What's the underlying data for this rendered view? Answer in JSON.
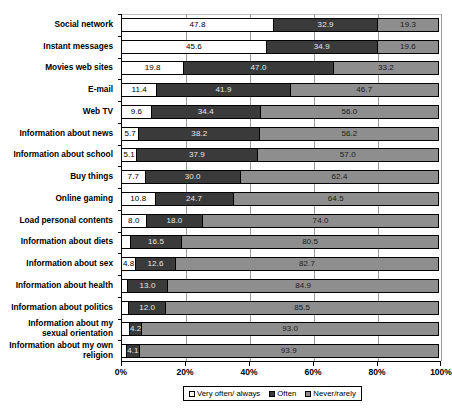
{
  "chart_data": {
    "type": "bar",
    "orientation": "horizontal",
    "stacked": true,
    "stacked_percent": true,
    "title": "",
    "subtitle": "",
    "xlabel": "",
    "ylabel": "",
    "xlim": [
      0,
      100
    ],
    "xticks": [
      0,
      20,
      40,
      60,
      80,
      100
    ],
    "xtick_labels": [
      "0%",
      "20%",
      "40%",
      "60%",
      "80%",
      "100%"
    ],
    "grid": true,
    "grid_axis": "x",
    "legend_position": "bottom",
    "categories": [
      "Social network",
      "Instant messages",
      "Movies web sites",
      "E-mail",
      "Web TV",
      "Information about news",
      "Information about school",
      "Buy things",
      "Online gaming",
      "Load personal contents",
      "Information about diets",
      "Information about sex",
      "Information about health",
      "Information about politics",
      "Information about my sexual orientation",
      "Information about my own religion"
    ],
    "series": [
      {
        "name": "Very often/ always",
        "color": "#ffffff",
        "values": [
          47.8,
          45.6,
          19.8,
          11.4,
          9.6,
          5.7,
          5.1,
          7.7,
          10.8,
          8.0,
          3.0,
          4.8,
          2.1,
          2.5,
          2.8,
          2.0
        ],
        "labels": [
          "47.8",
          "45.6",
          "19.8",
          "11.4",
          "9.6",
          "5.7",
          "5.1",
          "7.7",
          "10.8",
          "8.0",
          "",
          "4.8",
          "",
          "",
          "",
          ""
        ]
      },
      {
        "name": "Often",
        "color": "#3a3a3a",
        "values": [
          32.9,
          34.9,
          47.0,
          41.9,
          34.4,
          38.2,
          37.9,
          30.0,
          24.7,
          18.0,
          16.5,
          12.6,
          13.0,
          12.0,
          4.2,
          4.1
        ],
        "labels": [
          "32.9",
          "34.9",
          "47.0",
          "41.9",
          "34.4",
          "38.2",
          "37.9",
          "30.0",
          "24.7",
          "18.0",
          "16.5",
          "12.6",
          "13.0",
          "12.0",
          "4.2",
          "4.1"
        ]
      },
      {
        "name": "Never/rarely",
        "color": "#8e8e8e",
        "values": [
          19.3,
          19.6,
          33.2,
          46.7,
          56.0,
          56.2,
          57.0,
          62.4,
          64.5,
          74.0,
          80.5,
          82.7,
          84.9,
          85.5,
          93.0,
          93.9
        ],
        "labels": [
          "19.3",
          "19.6",
          "33.2",
          "46.7",
          "56.0",
          "56.2",
          "57.0",
          "62.4",
          "64.5",
          "74.0",
          "80.5",
          "82.7",
          "84.9",
          "85.5",
          "93.0",
          "93.9"
        ]
      }
    ]
  },
  "legend": {
    "items": [
      {
        "label": "Very often/ always",
        "swatch": "legend-swatch-very-often"
      },
      {
        "label": "Often",
        "swatch": "legend-swatch-often"
      },
      {
        "label": "Never/rarely",
        "swatch": "legend-swatch-never"
      }
    ]
  }
}
